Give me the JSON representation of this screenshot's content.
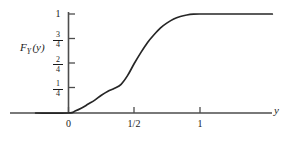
{
  "figure": {
    "background_color": "#ffffff",
    "line_color": "#262626",
    "axis_color": "#4d4d4d"
  },
  "axes": {
    "y_axis_title": {
      "base": "F",
      "subscript": "Y",
      "argument": "(y)",
      "full": "F_Y (y)"
    },
    "x_axis_variable": "y",
    "x_ticks": [
      {
        "label": "0",
        "value": 0
      },
      {
        "label": "1/2",
        "value": 0.5,
        "numerator": "1",
        "denominator": "2"
      },
      {
        "label": "1",
        "value": 1
      }
    ],
    "y_ticks": [
      {
        "label": "1/4",
        "value": 0.25,
        "numerator": "1",
        "denominator": "4"
      },
      {
        "label": "2/4",
        "value": 0.5,
        "numerator": "2",
        "denominator": "4"
      },
      {
        "label": "3/4",
        "value": 0.75,
        "numerator": "3",
        "denominator": "4"
      },
      {
        "label": "1",
        "value": 1
      }
    ]
  },
  "chart_data": {
    "type": "line",
    "title": "",
    "xlabel": "y",
    "ylabel": "F_Y (y)",
    "xlim": [
      -0.25,
      1.55
    ],
    "ylim": [
      0,
      1.08
    ],
    "grid": false,
    "legend": null,
    "series": [
      {
        "name": "F_Y(y)",
        "description": "Cumulative distribution function: zero for y<=0, S-shaped rise with a shoulder near 1/4, steep slope near y=1/2, saturating at 1 by y=1",
        "x": [
          -0.25,
          0.0,
          0.05,
          0.1,
          0.15,
          0.2,
          0.25,
          0.3,
          0.35,
          0.4,
          0.45,
          0.5,
          0.55,
          0.6,
          0.65,
          0.7,
          0.75,
          0.8,
          0.85,
          0.9,
          0.95,
          1.0,
          1.1,
          1.25,
          1.4,
          1.55
        ],
        "y": [
          0.0,
          0.0,
          0.02,
          0.05,
          0.09,
          0.13,
          0.18,
          0.22,
          0.25,
          0.29,
          0.38,
          0.5,
          0.61,
          0.71,
          0.79,
          0.86,
          0.91,
          0.95,
          0.975,
          0.99,
          0.998,
          1.0,
          1.0,
          1.0,
          1.0,
          1.0
        ]
      }
    ],
    "annotations": [
      {
        "text": "F_Y(0) = 0",
        "x": 0,
        "y": 0
      },
      {
        "text": "F_Y(1/2) = 2/4",
        "x": 0.5,
        "y": 0.5
      },
      {
        "text": "F_Y(1) = 1",
        "x": 1,
        "y": 1
      }
    ]
  }
}
